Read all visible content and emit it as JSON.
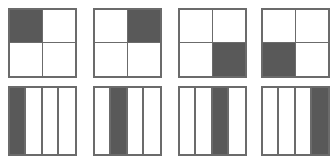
{
  "figure": {
    "background_color": "#ffffff",
    "shaded_color": "#595959",
    "unshaded_color": "#ffffff",
    "border_color": "#6b6b6b",
    "rows": 2,
    "columns": 4
  },
  "chart_data": {
    "type": "table",
    "xlabel": "",
    "ylabel": "",
    "legend": [],
    "annotations": [],
    "grid": true,
    "rows": [
      {
        "name": "top-row",
        "figure_type": "2x2-grid",
        "cells_per_figure": 4,
        "cell_order": [
          "top-left",
          "top-right",
          "bottom-left",
          "bottom-right"
        ],
        "figures": [
          {
            "index": 1,
            "shaded_cell_index": 0,
            "shaded_cell": "top-left",
            "shaded_count": 1,
            "fraction": "1/4"
          },
          {
            "index": 2,
            "shaded_cell_index": 1,
            "shaded_cell": "top-right",
            "shaded_count": 1,
            "fraction": "1/4"
          },
          {
            "index": 3,
            "shaded_cell_index": 3,
            "shaded_cell": "bottom-right",
            "shaded_count": 1,
            "fraction": "1/4"
          },
          {
            "index": 4,
            "shaded_cell_index": 2,
            "shaded_cell": "bottom-left",
            "shaded_count": 1,
            "fraction": "1/4"
          }
        ]
      },
      {
        "name": "bottom-row",
        "figure_type": "4-column-grid",
        "cells_per_figure": 4,
        "cell_order": [
          "column-1",
          "column-2",
          "column-3",
          "column-4"
        ],
        "figures": [
          {
            "index": 1,
            "shaded_cell_index": 0,
            "shaded_cell": "column-1",
            "shaded_count": 1,
            "fraction": "1/4"
          },
          {
            "index": 2,
            "shaded_cell_index": 1,
            "shaded_cell": "column-2",
            "shaded_count": 1,
            "fraction": "1/4"
          },
          {
            "index": 3,
            "shaded_cell_index": 2,
            "shaded_cell": "column-3",
            "shaded_count": 1,
            "fraction": "1/4"
          },
          {
            "index": 4,
            "shaded_cell_index": 3,
            "shaded_cell": "column-4",
            "shaded_count": 1,
            "fraction": "1/4"
          }
        ]
      }
    ]
  }
}
